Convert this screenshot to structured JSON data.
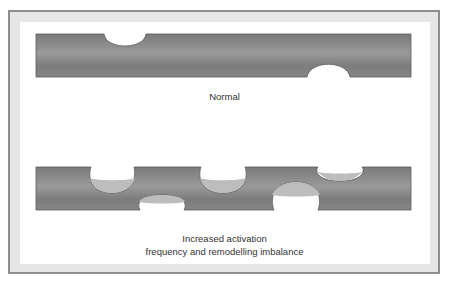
{
  "diagram": {
    "panels": [
      {
        "id": "normal",
        "label": "Normal",
        "bar": {
          "x": 36,
          "y": 34,
          "width": 375,
          "height": 43
        },
        "resorption_pits": [
          {
            "edge": "top",
            "x_start": 104,
            "x_end": 146,
            "depth": 18,
            "refilled": false
          },
          {
            "edge": "bottom",
            "x_start": 307,
            "x_end": 350,
            "depth": 15,
            "refilled": false
          }
        ]
      },
      {
        "id": "increased",
        "label_line1": "Increased activation",
        "label_line2": "frequency and remodelling imbalance",
        "bar": {
          "x": 36,
          "y": 167,
          "width": 375,
          "height": 43
        },
        "resorption_pits": [
          {
            "edge": "top",
            "x_start": 91,
            "x_end": 134,
            "depth": 26,
            "refilled_depth": 13
          },
          {
            "edge": "bottom",
            "x_start": 140,
            "x_end": 184,
            "depth": 15,
            "refilled_depth": 7
          },
          {
            "edge": "top",
            "x_start": 201,
            "x_end": 245,
            "depth": 26,
            "refilled_depth": 13
          },
          {
            "edge": "bottom",
            "x_start": 274,
            "x_end": 318,
            "depth": 29,
            "refilled_depth": 14
          },
          {
            "edge": "top",
            "x_start": 318,
            "x_end": 362,
            "depth": 15,
            "refilled_depth": 7
          }
        ]
      }
    ],
    "colors": {
      "bone_dark": "#6e6e6e",
      "bone_mid": "#8a8a8a",
      "bone_light": "#a4a4a4",
      "refill": "#bdbdbd",
      "frame": "#e6e6e6",
      "frame_border": "#8e8e8e",
      "text": "#333333"
    }
  }
}
